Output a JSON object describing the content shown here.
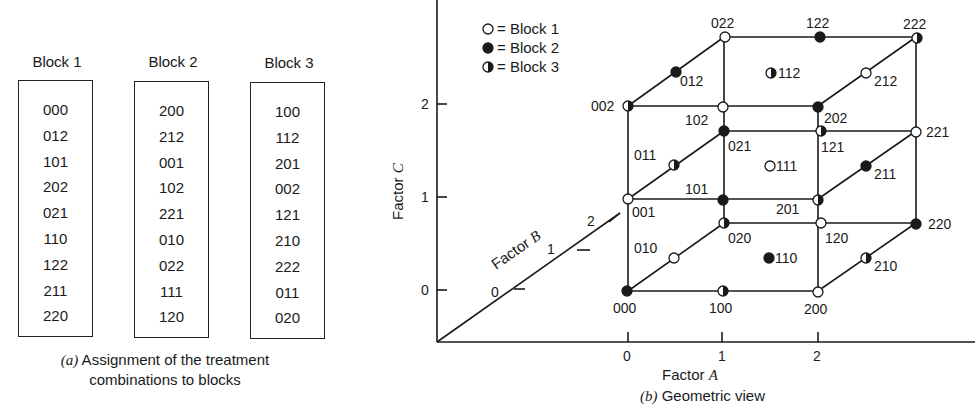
{
  "panel_a": {
    "blocks": [
      {
        "title": "Block 1",
        "entries": [
          "000",
          "012",
          "101",
          "202",
          "021",
          "110",
          "122",
          "211",
          "220"
        ]
      },
      {
        "title": "Block 2",
        "entries": [
          "200",
          "212",
          "001",
          "102",
          "221",
          "010",
          "022",
          "111",
          "120"
        ]
      },
      {
        "title": "Block 3",
        "entries": [
          "100",
          "112",
          "201",
          "002",
          "121",
          "210",
          "222",
          "011",
          "020"
        ]
      }
    ],
    "caption_prefix": "(a)",
    "caption_line1": " Assignment of the treatment",
    "caption_line2": "combinations to blocks"
  },
  "panel_b": {
    "legend": [
      {
        "marker": "open",
        "label": "= Block 1"
      },
      {
        "marker": "filled",
        "label": "= Block 2"
      },
      {
        "marker": "half",
        "label": "= Block 3"
      }
    ],
    "axis_c": {
      "label": "Factor ",
      "var": "C",
      "ticks": [
        "0",
        "1",
        "2"
      ]
    },
    "axis_b": {
      "label": "Factor ",
      "var": "B",
      "ticks": [
        "0",
        "1",
        "2"
      ]
    },
    "axis_a": {
      "label": "Factor ",
      "var": "A",
      "ticks": [
        "0",
        "1",
        "2"
      ]
    },
    "caption_prefix": "(b)",
    "caption_text": " Geometric view",
    "points": [
      {
        "label": "000",
        "marker": "filled"
      },
      {
        "label": "100",
        "marker": "half"
      },
      {
        "label": "200",
        "marker": "open"
      },
      {
        "label": "010",
        "marker": "open"
      },
      {
        "label": "110",
        "marker": "filled"
      },
      {
        "label": "210",
        "marker": "half"
      },
      {
        "label": "020",
        "marker": "half"
      },
      {
        "label": "120",
        "marker": "open"
      },
      {
        "label": "220",
        "marker": "filled"
      },
      {
        "label": "001",
        "marker": "open"
      },
      {
        "label": "101",
        "marker": "filled"
      },
      {
        "label": "201",
        "marker": "half"
      },
      {
        "label": "011",
        "marker": "half"
      },
      {
        "label": "111",
        "marker": "open"
      },
      {
        "label": "211",
        "marker": "filled"
      },
      {
        "label": "021",
        "marker": "filled"
      },
      {
        "label": "121",
        "marker": "half"
      },
      {
        "label": "221",
        "marker": "open"
      },
      {
        "label": "002",
        "marker": "half"
      },
      {
        "label": "102",
        "marker": "open"
      },
      {
        "label": "202",
        "marker": "filled"
      },
      {
        "label": "012",
        "marker": "filled"
      },
      {
        "label": "112",
        "marker": "half"
      },
      {
        "label": "212",
        "marker": "open"
      },
      {
        "label": "022",
        "marker": "open"
      },
      {
        "label": "122",
        "marker": "filled"
      },
      {
        "label": "222",
        "marker": "half"
      }
    ]
  }
}
